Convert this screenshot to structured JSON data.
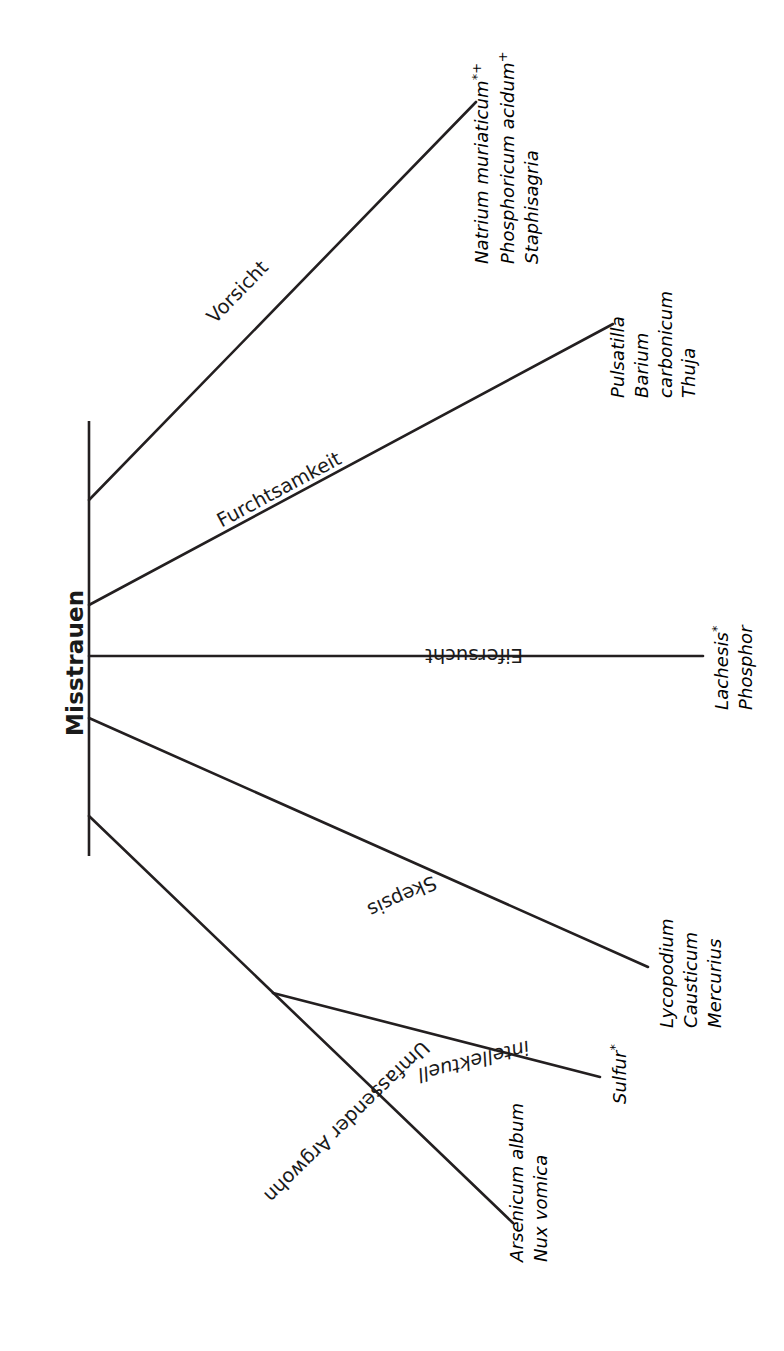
{
  "diagram": {
    "type": "tree-branch-diagram",
    "root_label": "Misstrauen",
    "line_color": "#231f20",
    "text_color": "#1a1a1a",
    "background": "#ffffff",
    "branches": [
      {
        "id": "vorsicht",
        "label": "Vorsicht",
        "remedies": [
          "Natrium muriaticum",
          "Phosphoricum acidum",
          "Staphisagria"
        ],
        "remedy_marks": [
          "*+",
          "+",
          ""
        ]
      },
      {
        "id": "furchtsamkeit",
        "label": "Furchtsamkeit",
        "remedies": [
          "Pulsatilla",
          "Barium carbonicum",
          "Thuja"
        ],
        "remedy_marks": [
          "",
          "",
          ""
        ]
      },
      {
        "id": "eifersucht",
        "label": "Eifersucht",
        "remedies": [
          "Lachesis",
          "Phosphor"
        ],
        "remedy_marks": [
          "*",
          ""
        ]
      },
      {
        "id": "skepsis",
        "label": "Skepsis",
        "remedies": [
          "Lycopodium",
          "Causticum",
          "Mercurius"
        ],
        "remedy_marks": [
          "",
          "",
          ""
        ]
      },
      {
        "id": "umfassender-argwohn",
        "label": "Umfassender Argwohn",
        "remedies": [
          "Arsenicum album",
          "Nux vomica"
        ],
        "remedy_marks": [
          "",
          ""
        ]
      },
      {
        "id": "intellektuell",
        "label": "intellektuell",
        "remedies": [
          "Sulfur"
        ],
        "remedy_marks": [
          "*"
        ]
      }
    ]
  },
  "labels": {
    "root": "Misstrauen",
    "vorsicht": "Vorsicht",
    "furchtsamkeit": "Furchtsamkeit",
    "eifersucht": "Eifersucht",
    "skepsis": "Skepsis",
    "argwohn": "Umfassender Argwohn",
    "intellektuell": "intellektuell"
  },
  "remedies": {
    "natrium_muriaticum": "Natrium muriaticum",
    "natrium_muriaticum_mark": "*+",
    "phosphoricum_acidum": "Phosphoricum acidum",
    "phosphoricum_acidum_mark": "+",
    "staphisagria": "Staphisagria",
    "pulsatilla": "Pulsatilla",
    "barium_carbonicum": "Barium carbonicum",
    "thuja": "Thuja",
    "lachesis": "Lachesis",
    "lachesis_mark": "*",
    "phosphor": "Phosphor",
    "lycopodium": "Lycopodium",
    "causticum": "Causticum",
    "mercurius": "Mercurius",
    "sulfur": "Sulfur",
    "sulfur_mark": "*",
    "arsenicum_album": "Arsenicum album",
    "nux_vomica": "Nux vomica"
  }
}
